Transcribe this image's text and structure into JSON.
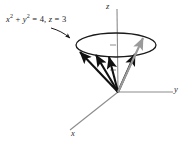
{
  "figure": {
    "background_color": "#ffffff",
    "axis_color": "#8c8c8c",
    "curve_color": "#1a1a1a",
    "vector_color": "#111111",
    "highlight_vector_color": "#9a9a9a",
    "label_color": "#1a1a1a"
  },
  "annotation": {
    "equation_prefix": "x",
    "equation_sup1": "2",
    "equation_plus": " + ",
    "equation_var2": "y",
    "equation_sup2": "2",
    "equation_eq1": " = 4, ",
    "equation_var3": "z",
    "equation_eq2": " = 3",
    "equation_plain": "x2 + y2 = 4, z = 3",
    "leader_description": "curved arrow from equation label to circle rim"
  },
  "axes": [
    {
      "id": "z",
      "label": "z",
      "direction": "up"
    },
    {
      "id": "y",
      "label": "y",
      "direction": "right"
    },
    {
      "id": "x",
      "label": "x",
      "direction": "lower-left"
    }
  ],
  "geometry": {
    "origin": {
      "x": 118,
      "y": 92
    },
    "circle_center": {
      "x": 116,
      "y": 45
    },
    "circle_radius_x": 40,
    "circle_radius_y": 12,
    "radius_value": 2,
    "plane_height": 3,
    "tick_marks": 2
  },
  "vectors": [
    {
      "id": "v1",
      "tip_x": 79,
      "tip_y": 51,
      "color": "dark"
    },
    {
      "id": "v2",
      "tip_x": 95,
      "tip_y": 54,
      "color": "dark"
    },
    {
      "id": "v3",
      "tip_x": 108,
      "tip_y": 56,
      "color": "dark"
    },
    {
      "id": "v4",
      "tip_x": 134,
      "tip_y": 53,
      "color": "dark"
    },
    {
      "id": "v5",
      "tip_x": 142,
      "tip_y": 37,
      "color": "gray"
    }
  ]
}
